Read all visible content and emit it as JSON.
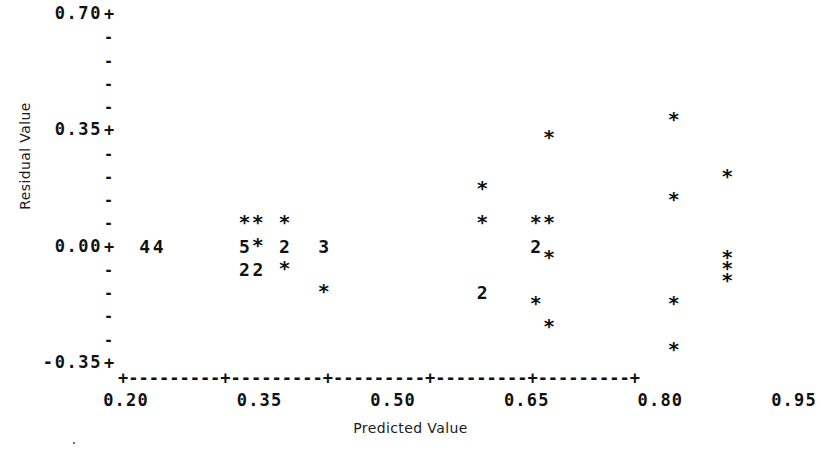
{
  "chart_data": {
    "type": "scatter",
    "title": "",
    "xlabel": "Predicted Value",
    "ylabel": "Residual Value",
    "xlim": [
      0.2,
      0.95
    ],
    "ylim": [
      -0.35,
      0.7
    ],
    "xticks": [
      "0.20",
      "0.35",
      "0.50",
      "0.65",
      "0.80",
      "0.95"
    ],
    "yticks": [
      "0.70",
      "0.35",
      "0.00",
      "-0.35"
    ],
    "grid": false,
    "legend": null,
    "marker_legend": {
      "star": "1 observation",
      "digit": "count of coincident observations"
    },
    "points": [
      {
        "label": "4",
        "x": 0.221,
        "y": 0.0,
        "count": 4
      },
      {
        "label": "4",
        "x": 0.236,
        "y": 0.0,
        "count": 4
      },
      {
        "label": "*",
        "x": 0.333,
        "y": 0.07,
        "count": 1
      },
      {
        "label": "*",
        "x": 0.348,
        "y": 0.07,
        "count": 1
      },
      {
        "label": "*",
        "x": 0.378,
        "y": 0.07,
        "count": 1
      },
      {
        "label": "5",
        "x": 0.333,
        "y": 0.0,
        "count": 5
      },
      {
        "label": "*",
        "x": 0.348,
        "y": 0.0,
        "count": 1
      },
      {
        "label": "2",
        "x": 0.378,
        "y": 0.0,
        "count": 2
      },
      {
        "label": "3",
        "x": 0.422,
        "y": 0.0,
        "count": 3
      },
      {
        "label": "2",
        "x": 0.333,
        "y": -0.07,
        "count": 2
      },
      {
        "label": "2",
        "x": 0.348,
        "y": -0.07,
        "count": 2
      },
      {
        "label": "*",
        "x": 0.378,
        "y": -0.07,
        "count": 1
      },
      {
        "label": "*",
        "x": 0.422,
        "y": -0.14,
        "count": 1
      },
      {
        "label": "*",
        "x": 0.6,
        "y": 0.175,
        "count": 1
      },
      {
        "label": "*",
        "x": 0.6,
        "y": 0.07,
        "count": 1
      },
      {
        "label": "2",
        "x": 0.6,
        "y": -0.14,
        "count": 1
      },
      {
        "label": "*",
        "x": 0.66,
        "y": 0.07,
        "count": 1
      },
      {
        "label": "2",
        "x": 0.66,
        "y": 0.0,
        "count": 2
      },
      {
        "label": "*",
        "x": 0.66,
        "y": -0.175,
        "count": 1
      },
      {
        "label": "*",
        "x": 0.675,
        "y": 0.33,
        "count": 1
      },
      {
        "label": "*",
        "x": 0.675,
        "y": 0.07,
        "count": 1
      },
      {
        "label": "*",
        "x": 0.675,
        "y": -0.035,
        "count": 1
      },
      {
        "label": "*",
        "x": 0.675,
        "y": -0.245,
        "count": 1
      },
      {
        "label": "*",
        "x": 0.815,
        "y": 0.385,
        "count": 1
      },
      {
        "label": "*",
        "x": 0.815,
        "y": 0.14,
        "count": 1
      },
      {
        "label": "*",
        "x": 0.815,
        "y": -0.175,
        "count": 1
      },
      {
        "label": "*",
        "x": 0.815,
        "y": -0.315,
        "count": 1
      },
      {
        "label": "*",
        "x": 0.875,
        "y": 0.21,
        "count": 1
      },
      {
        "label": "*",
        "x": 0.875,
        "y": -0.035,
        "count": 1
      },
      {
        "label": "*",
        "x": 0.875,
        "y": -0.07,
        "count": 1
      },
      {
        "label": "*",
        "x": 0.875,
        "y": -0.105,
        "count": 1
      }
    ]
  },
  "axes": {
    "y_major_glyph": "+",
    "y_minor_glyph": "-",
    "x_axis_line": "+---------+---------+---------+---------+---------+",
    "y_tick_rows": [
      {
        "value": "0.70",
        "glyph": "+",
        "label": "0.70+"
      },
      {
        "value": "",
        "glyph": "-",
        "label": ""
      },
      {
        "value": "",
        "glyph": "-",
        "label": ""
      },
      {
        "value": "",
        "glyph": "-",
        "label": ""
      },
      {
        "value": "",
        "glyph": "-",
        "label": ""
      },
      {
        "value": "0.35",
        "glyph": "+",
        "label": "0.35+"
      },
      {
        "value": "",
        "glyph": "-",
        "label": ""
      },
      {
        "value": "",
        "glyph": "-",
        "label": ""
      },
      {
        "value": "",
        "glyph": "-",
        "label": ""
      },
      {
        "value": "",
        "glyph": "-",
        "label": ""
      },
      {
        "value": "0.00",
        "glyph": "+",
        "label": "0.00+"
      },
      {
        "value": "",
        "glyph": "-",
        "label": ""
      },
      {
        "value": "",
        "glyph": "-",
        "label": ""
      },
      {
        "value": "",
        "glyph": "-",
        "label": ""
      },
      {
        "value": "",
        "glyph": "-",
        "label": ""
      },
      {
        "value": "-0.35",
        "glyph": "+",
        "label": "-0.35+"
      }
    ]
  },
  "stray_mark": "."
}
